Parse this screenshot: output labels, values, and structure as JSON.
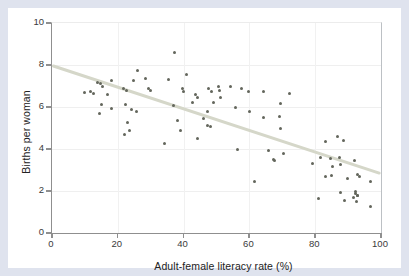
{
  "chart_data": {
    "type": "scatter",
    "title": "",
    "xlabel": "Adult-female literacy rate (%)",
    "ylabel": "Births per woman",
    "xlim": [
      0,
      100
    ],
    "ylim": [
      0,
      10
    ],
    "xticks": [
      0,
      20,
      40,
      60,
      80,
      100
    ],
    "yticks": [
      0,
      2,
      4,
      6,
      8,
      10
    ],
    "grid": "faint",
    "legend": "none",
    "trend_line": {
      "x1": 0,
      "y1": 8.0,
      "x2": 100,
      "y2": 2.85
    },
    "points": [
      [
        13.8,
        7.15
      ],
      [
        14.6,
        7.1
      ],
      [
        15.3,
        7.0
      ],
      [
        18,
        7.25
      ],
      [
        10,
        6.7
      ],
      [
        11.8,
        6.75
      ],
      [
        12.5,
        6.65
      ],
      [
        16.9,
        6.6
      ],
      [
        21.6,
        6.9
      ],
      [
        22.6,
        6.8
      ],
      [
        26,
        7.75
      ],
      [
        24.8,
        7.25
      ],
      [
        28.4,
        7.35
      ],
      [
        29.4,
        6.9
      ],
      [
        30,
        6.8
      ],
      [
        22.3,
        6.1
      ],
      [
        14.9,
        6.1
      ],
      [
        14.4,
        5.7
      ],
      [
        18.2,
        5.95
      ],
      [
        24.1,
        5.9
      ],
      [
        25.6,
        5.8
      ],
      [
        23,
        5.25
      ],
      [
        23.6,
        4.9
      ],
      [
        21.9,
        4.7
      ],
      [
        37.2,
        8.6
      ],
      [
        35.5,
        7.3
      ],
      [
        40.9,
        7.55
      ],
      [
        39.8,
        6.9
      ],
      [
        40,
        6.75
      ],
      [
        43.6,
        6.6
      ],
      [
        44.3,
        6.45
      ],
      [
        42.8,
        6.2
      ],
      [
        47.7,
        6.9
      ],
      [
        48.5,
        6.75
      ],
      [
        50.7,
        7.0
      ],
      [
        51,
        6.8
      ],
      [
        51.2,
        6.45
      ],
      [
        49.1,
        6.2
      ],
      [
        37,
        6.05
      ],
      [
        38.2,
        5.35
      ],
      [
        39.2,
        4.9
      ],
      [
        45.9,
        5.45
      ],
      [
        47.3,
        5.8
      ],
      [
        47.2,
        5.1
      ],
      [
        48.3,
        5.05
      ],
      [
        57.6,
        6.9
      ],
      [
        59.6,
        6.75
      ],
      [
        64.4,
        6.75
      ],
      [
        59.9,
        5.8
      ],
      [
        64.2,
        5.5
      ],
      [
        72.3,
        6.65
      ],
      [
        69.5,
        6.15
      ],
      [
        69.2,
        5.55
      ],
      [
        69.5,
        5.0
      ],
      [
        34.2,
        4.25
      ],
      [
        56.3,
        4.0
      ],
      [
        65.7,
        3.95
      ],
      [
        67.7,
        3.45
      ],
      [
        61.7,
        2.45
      ],
      [
        67.3,
        3.5
      ],
      [
        70.3,
        3.8
      ],
      [
        79.2,
        3.3
      ],
      [
        81.5,
        3.6
      ],
      [
        84.5,
        3.55
      ],
      [
        87.3,
        3.6
      ],
      [
        83,
        2.7
      ],
      [
        84.9,
        2.75
      ],
      [
        87.6,
        3.25
      ],
      [
        89.8,
        2.6
      ],
      [
        91.8,
        3.45
      ],
      [
        93,
        2.8
      ],
      [
        93.6,
        2.7
      ],
      [
        92.3,
        1.9
      ],
      [
        93,
        1.8
      ],
      [
        91.5,
        1.7
      ],
      [
        88.8,
        1.55
      ],
      [
        96.7,
        2.45
      ],
      [
        80.9,
        1.65
      ],
      [
        87.6,
        1.95
      ],
      [
        92.1,
        2.0
      ],
      [
        92.9,
        1.8
      ],
      [
        92.6,
        1.5
      ],
      [
        96.7,
        1.25
      ],
      [
        83.2,
        4.35
      ],
      [
        86.8,
        4.6
      ],
      [
        88.6,
        4.4
      ],
      [
        85.3,
        3.15
      ],
      [
        54.3,
        7.0
      ],
      [
        55.8,
        6.0
      ],
      [
        44.1,
        4.5
      ]
    ],
    "colors": {
      "point": "#63665c",
      "trend": "#d5d7c9",
      "figure_frame": "#dfe3ee",
      "plot_bg": "#ffffff",
      "axis": "#8f8f8f",
      "text": "#222222"
    }
  }
}
